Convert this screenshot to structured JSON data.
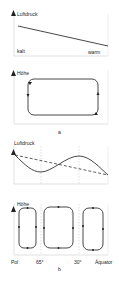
{
  "panel_a": {
    "pressure_label": "Luftdruck",
    "left_label": "kalt",
    "right_label": "warm",
    "height_label": "Höhe",
    "caption": "a"
  },
  "panel_b": {
    "pressure_label": "Luftdruck",
    "height_label": "Höhe",
    "x_labels": [
      "Pol",
      "65°",
      "30°",
      "Äquator"
    ],
    "caption": "b"
  },
  "colors": {
    "line": "#333333",
    "frame": "#cccccc",
    "grid": "#bbbbbb"
  }
}
